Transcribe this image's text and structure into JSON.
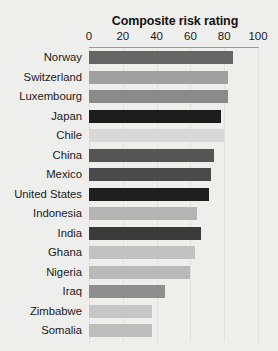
{
  "chart_data": {
    "type": "bar",
    "orientation": "horizontal",
    "title": "Composite risk rating",
    "xlabel": "",
    "ylabel": "",
    "xlim": [
      0,
      100
    ],
    "xticks": [
      0,
      20,
      40,
      60,
      80,
      100
    ],
    "grid": true,
    "legend": "none",
    "axis_position": "top",
    "categories": [
      "Norway",
      "Switzerland",
      "Luxembourg",
      "Japan",
      "Chile",
      "China",
      "Mexico",
      "United States",
      "Indonesia",
      "India",
      "Ghana",
      "Nigeria",
      "Iraq",
      "Zimbabwe",
      "Somalia"
    ],
    "values": [
      85,
      82,
      82,
      78,
      80,
      74,
      72,
      71,
      64,
      66,
      63,
      60,
      45,
      37,
      37
    ],
    "bar_colors": [
      "#656565",
      "#a0a0a0",
      "#8a8a8a",
      "#1c1c1c",
      "#d8d8d8",
      "#555555",
      "#4a4a4a",
      "#1f1f1f",
      "#b4b4b4",
      "#3a3a3a",
      "#c2c2c2",
      "#b9b9b9",
      "#8e8e8e",
      "#c6c6c6",
      "#bdbdbd"
    ],
    "bars": [
      {
        "label": "Norway",
        "value": 85,
        "color": "#656565"
      },
      {
        "label": "Switzerland",
        "value": 82,
        "color": "#a0a0a0"
      },
      {
        "label": "Luxembourg",
        "value": 82,
        "color": "#8a8a8a"
      },
      {
        "label": "Japan",
        "value": 78,
        "color": "#1c1c1c"
      },
      {
        "label": "Chile",
        "value": 80,
        "color": "#d8d8d8"
      },
      {
        "label": "China",
        "value": 74,
        "color": "#555555"
      },
      {
        "label": "Mexico",
        "value": 72,
        "color": "#4a4a4a"
      },
      {
        "label": "United States",
        "value": 71,
        "color": "#1f1f1f"
      },
      {
        "label": "Indonesia",
        "value": 64,
        "color": "#b4b4b4"
      },
      {
        "label": "India",
        "value": 66,
        "color": "#3a3a3a"
      },
      {
        "label": "Ghana",
        "value": 63,
        "color": "#c2c2c2"
      },
      {
        "label": "Nigeria",
        "value": 60,
        "color": "#b9b9b9"
      },
      {
        "label": "Iraq",
        "value": 45,
        "color": "#8e8e8e"
      },
      {
        "label": "Zimbabwe",
        "value": 37,
        "color": "#c6c6c6"
      },
      {
        "label": "Somalia",
        "value": 37,
        "color": "#bdbdbd"
      }
    ]
  },
  "style": {
    "background": "#eeeeec",
    "axis_line_color": "#9a9a98",
    "gridline_color": "#e2e2df",
    "text_color": "#1a1a1a"
  }
}
